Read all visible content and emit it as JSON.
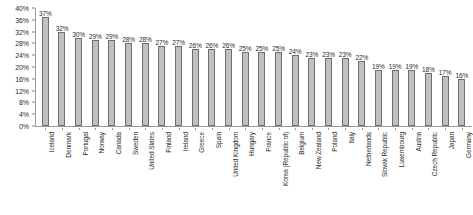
{
  "chart_data": {
    "type": "bar",
    "title": "",
    "subtitle": "",
    "xlabel": "",
    "ylabel": "",
    "ylim": [
      0,
      40
    ],
    "ytick_step": 4,
    "ytick_labels": [
      "40%",
      "36%",
      "32%",
      "28%",
      "24%",
      "20%",
      "16%",
      "12%",
      "8%",
      "4%",
      "0%"
    ],
    "ytick_values": [
      40,
      36,
      32,
      28,
      24,
      20,
      16,
      12,
      8,
      4,
      0
    ],
    "grid": false,
    "legend": "none",
    "value_suffix": "%",
    "categories": [
      "Iceland",
      "Denmark",
      "Portugal",
      "Norway",
      "Canada",
      "Sweden",
      "United States",
      "Finland",
      "Ireland",
      "Greece",
      "Spain",
      "United Kingdom",
      "Hungary",
      "France",
      "Korea (Republic of)",
      "Belgium",
      "New Zealand",
      "Poland",
      "Italy",
      "Netherlands",
      "Slovak Republic",
      "Luxembourg",
      "Austria",
      "Czech Republic",
      "Japan",
      "Germany"
    ],
    "values": [
      37,
      32,
      30,
      29,
      29,
      28,
      28,
      27,
      27,
      26,
      26,
      26,
      25,
      25,
      25,
      24,
      23,
      23,
      23,
      22,
      19,
      19,
      19,
      18,
      17,
      16
    ],
    "data_labels": [
      "37%",
      "32%",
      "30%",
      "29%",
      "29%",
      "28%",
      "28%",
      "27%",
      "27%",
      "26%",
      "26%",
      "26%",
      "25%",
      "25%",
      "25%",
      "24%",
      "23%",
      "23%",
      "23%",
      "22%",
      "19%",
      "19%",
      "19%",
      "18%",
      "17%",
      "16%"
    ],
    "colors": {
      "bar_fill": "#c0c0c0",
      "bar_border": "#6e6e6e",
      "axis": "#9a9a9a",
      "text": "#2b2b2b",
      "background": "#ffffff"
    }
  }
}
